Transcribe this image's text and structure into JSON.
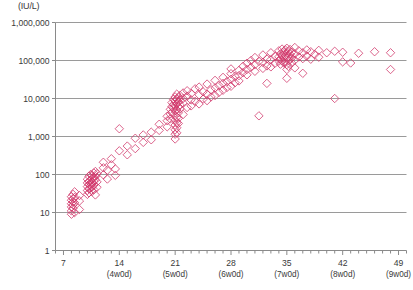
{
  "chart_data": {
    "type": "scatter",
    "title": "",
    "unit_label": "(IU/L)",
    "ylabel": "",
    "xlabel": "",
    "grid": true,
    "legend": false,
    "yscale": "log",
    "ylim": [
      1,
      1000000
    ],
    "ytick_values": [
      1,
      10,
      100,
      1000,
      10000,
      100000,
      1000000
    ],
    "ytick_labels": [
      "1",
      "10",
      "100",
      "1,000",
      "10,000",
      "100,000",
      "1,000,000"
    ],
    "xlim": [
      6,
      50
    ],
    "xtick_values": [
      7,
      14,
      21,
      28,
      35,
      42,
      49
    ],
    "xtick_labels": [
      "7",
      "14",
      "21",
      "28",
      "35",
      "42",
      "49"
    ],
    "xtick_sublabels": [
      "",
      "(4w0d)",
      "(5w0d)",
      "(6w0d)",
      "(7w0d)",
      "(8w0d)",
      "(9w0d)"
    ],
    "xminor_step": 1,
    "marker": "open-diamond",
    "marker_color": "#d1376a",
    "marker_color_light": "#e79bb4",
    "marker_size": 4.2,
    "axis_color": "#8a8a8a",
    "grid_color": "#9a9a9a",
    "series": [
      {
        "name": "hCG",
        "points": [
          [
            8,
            14
          ],
          [
            8,
            17
          ],
          [
            8,
            21
          ],
          [
            8,
            11
          ],
          [
            8,
            26
          ],
          [
            8,
            9
          ],
          [
            8.2,
            19
          ],
          [
            8.2,
            13
          ],
          [
            8.2,
            30
          ],
          [
            8.2,
            23
          ],
          [
            8.2,
            16
          ],
          [
            8.4,
            10
          ],
          [
            8.4,
            25
          ],
          [
            8.4,
            35
          ],
          [
            8.4,
            18
          ],
          [
            9,
            12
          ],
          [
            9,
            28
          ],
          [
            9,
            20
          ],
          [
            10,
            48
          ],
          [
            10,
            60
          ],
          [
            10,
            38
          ],
          [
            10,
            75
          ],
          [
            10,
            30
          ],
          [
            10.2,
            55
          ],
          [
            10.2,
            42
          ],
          [
            10.2,
            90
          ],
          [
            10.2,
            66
          ],
          [
            10.2,
            33
          ],
          [
            10.4,
            70
          ],
          [
            10.4,
            51
          ],
          [
            10.4,
            100
          ],
          [
            10.4,
            44
          ],
          [
            10.4,
            58
          ],
          [
            10.6,
            80
          ],
          [
            10.6,
            62
          ],
          [
            10.6,
            36
          ],
          [
            10.6,
            95
          ],
          [
            10.6,
            47
          ],
          [
            10.8,
            85
          ],
          [
            10.8,
            53
          ],
          [
            10.8,
            40
          ],
          [
            10.8,
            110
          ],
          [
            10.8,
            68
          ],
          [
            11,
            120
          ],
          [
            11,
            72
          ],
          [
            11,
            29
          ],
          [
            11,
            88
          ],
          [
            11.2,
            64
          ],
          [
            11.2,
            105
          ],
          [
            11.2,
            46
          ],
          [
            12,
            150
          ],
          [
            12,
            98
          ],
          [
            12,
            210
          ],
          [
            12.5,
            130
          ],
          [
            12.5,
            76
          ],
          [
            13,
            260
          ],
          [
            13,
            180
          ],
          [
            13.5,
            95
          ],
          [
            13.5,
            140
          ],
          [
            14,
            1600
          ],
          [
            14,
            420
          ],
          [
            15,
            330
          ],
          [
            15,
            560
          ],
          [
            16,
            900
          ],
          [
            16,
            480
          ],
          [
            17,
            1100
          ],
          [
            17,
            700
          ],
          [
            18,
            1300
          ],
          [
            18,
            820
          ],
          [
            19,
            2100
          ],
          [
            19,
            1450
          ],
          [
            20,
            3400
          ],
          [
            20,
            2600
          ],
          [
            20,
            1800
          ],
          [
            20.4,
            5200
          ],
          [
            20.4,
            3900
          ],
          [
            20.4,
            2900
          ],
          [
            20.6,
            7800
          ],
          [
            20.6,
            6100
          ],
          [
            20.6,
            4400
          ],
          [
            20.8,
            9500
          ],
          [
            20.8,
            7000
          ],
          [
            20.8,
            5600
          ],
          [
            21,
            11000
          ],
          [
            21,
            8600
          ],
          [
            21,
            6500
          ],
          [
            21,
            4800
          ],
          [
            21,
            3600
          ],
          [
            21,
            2700
          ],
          [
            21,
            2000
          ],
          [
            21,
            1500
          ],
          [
            21,
            1150
          ],
          [
            21,
            860
          ],
          [
            21.2,
            13000
          ],
          [
            21.2,
            9800
          ],
          [
            21.2,
            7400
          ],
          [
            21.2,
            5000
          ],
          [
            21.2,
            3200
          ],
          [
            21.2,
            2300
          ],
          [
            21.2,
            1700
          ],
          [
            21.2,
            1250
          ],
          [
            21.4,
            10500
          ],
          [
            21.4,
            8000
          ],
          [
            21.4,
            6000
          ],
          [
            21.4,
            4200
          ],
          [
            21.4,
            3000
          ],
          [
            21.4,
            2200
          ],
          [
            21.6,
            12000
          ],
          [
            21.6,
            9000
          ],
          [
            21.6,
            6800
          ],
          [
            21.6,
            5400
          ],
          [
            22,
            14000
          ],
          [
            22,
            10000
          ],
          [
            22,
            7600
          ],
          [
            22,
            3800
          ],
          [
            22.5,
            16000
          ],
          [
            22.5,
            11500
          ],
          [
            22.5,
            5800
          ],
          [
            23,
            9200
          ],
          [
            23,
            6400
          ],
          [
            23,
            13500
          ],
          [
            23.5,
            18000
          ],
          [
            23.5,
            8400
          ],
          [
            24,
            12500
          ],
          [
            24,
            7200
          ],
          [
            24,
            20000
          ],
          [
            24.5,
            15000
          ],
          [
            24.5,
            9600
          ],
          [
            25,
            24000
          ],
          [
            25,
            13000
          ],
          [
            25,
            8800
          ],
          [
            25.5,
            17000
          ],
          [
            25.5,
            11000
          ],
          [
            26,
            30000
          ],
          [
            26,
            19000
          ],
          [
            26,
            12000
          ],
          [
            26.5,
            22000
          ],
          [
            26.5,
            14500
          ],
          [
            27,
            36000
          ],
          [
            27,
            25000
          ],
          [
            27,
            16500
          ],
          [
            27.5,
            28000
          ],
          [
            27.5,
            19500
          ],
          [
            28,
            45000
          ],
          [
            28,
            32000
          ],
          [
            28,
            21000
          ],
          [
            28,
            60000
          ],
          [
            28.5,
            38000
          ],
          [
            28.5,
            26000
          ],
          [
            29,
            55000
          ],
          [
            29,
            40000
          ],
          [
            29,
            29000
          ],
          [
            29.5,
            70000
          ],
          [
            29.5,
            48000
          ],
          [
            30,
            85000
          ],
          [
            30,
            58000
          ],
          [
            30,
            42000
          ],
          [
            30.5,
            100000
          ],
          [
            30.5,
            66000
          ],
          [
            31,
            120000
          ],
          [
            31,
            78000
          ],
          [
            31,
            52000
          ],
          [
            31.5,
            95000
          ],
          [
            31.5,
            3500
          ],
          [
            32,
            140000
          ],
          [
            32,
            90000
          ],
          [
            32,
            62000
          ],
          [
            32.5,
            110000
          ],
          [
            32.5,
            72000
          ],
          [
            32.5,
            25000
          ],
          [
            33,
            160000
          ],
          [
            33,
            105000
          ],
          [
            33,
            68000
          ],
          [
            33.5,
            130000
          ],
          [
            33.5,
            84000
          ],
          [
            34,
            180000
          ],
          [
            34,
            125000
          ],
          [
            34,
            96000
          ],
          [
            34.2,
            150000
          ],
          [
            34.2,
            110000
          ],
          [
            34.2,
            80000
          ],
          [
            34.4,
            200000
          ],
          [
            34.4,
            140000
          ],
          [
            34.4,
            100000
          ],
          [
            34.6,
            170000
          ],
          [
            34.6,
            120000
          ],
          [
            34.6,
            88000
          ],
          [
            34.8,
            190000
          ],
          [
            34.8,
            135000
          ],
          [
            34.8,
            92000
          ],
          [
            35,
            210000
          ],
          [
            35,
            155000
          ],
          [
            35,
            115000
          ],
          [
            35,
            78000
          ],
          [
            35,
            58000
          ],
          [
            35,
            34000
          ],
          [
            35.2,
            175000
          ],
          [
            35.2,
            128000
          ],
          [
            35.2,
            98000
          ],
          [
            35.2,
            70000
          ],
          [
            35.4,
            195000
          ],
          [
            35.4,
            145000
          ],
          [
            35.4,
            106000
          ],
          [
            35.6,
            165000
          ],
          [
            35.6,
            118000
          ],
          [
            35.6,
            86000
          ],
          [
            36,
            220000
          ],
          [
            36,
            150000
          ],
          [
            36,
            102000
          ],
          [
            36,
            64000
          ],
          [
            36.5,
            180000
          ],
          [
            36.5,
            124000
          ],
          [
            37,
            160000
          ],
          [
            37,
            112000
          ],
          [
            37,
            46000
          ],
          [
            37.5,
            190000
          ],
          [
            37.5,
            130000
          ],
          [
            38,
            170000
          ],
          [
            38,
            108000
          ],
          [
            38.5,
            145000
          ],
          [
            39,
            185000
          ],
          [
            39,
            122000
          ],
          [
            40,
            160000
          ],
          [
            41,
            175000
          ],
          [
            41,
            10000
          ],
          [
            42,
            165000
          ],
          [
            42,
            92000
          ],
          [
            43,
            86000
          ],
          [
            44,
            155000
          ],
          [
            46,
            170000
          ],
          [
            48,
            160000
          ],
          [
            48,
            58000
          ]
        ]
      }
    ]
  }
}
